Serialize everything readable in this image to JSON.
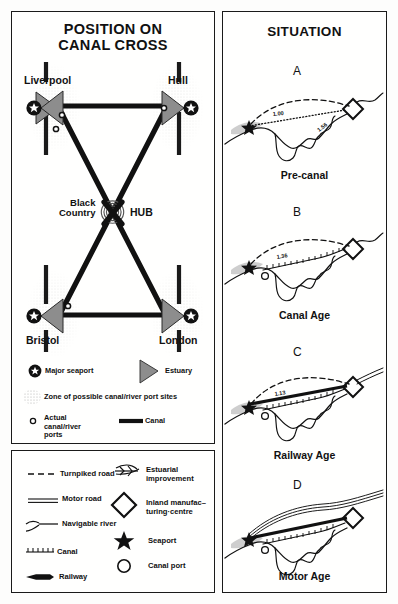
{
  "figure": {
    "background_color": "#fdfdfc",
    "ink_color": "#1a1a1a",
    "estuary_fill": "#8d8d8d",
    "zone_stipple_color": "#b9b9b9"
  },
  "map_panel": {
    "title_line1": "POSITION ON",
    "title_line2": "CANAL CROSS",
    "nodes": [
      {
        "id": "liverpool",
        "label": "Liverpool",
        "type": "major-seaport",
        "x": 38,
        "y": 96
      },
      {
        "id": "hull",
        "label": "Hull",
        "type": "major-seaport",
        "x": 178,
        "y": 96
      },
      {
        "id": "bristol",
        "label": "Bristol",
        "type": "major-seaport",
        "x": 38,
        "y": 310
      },
      {
        "id": "london",
        "label": "London",
        "type": "major-seaport",
        "x": 178,
        "y": 310
      }
    ],
    "hub": {
      "label_line1": "Black",
      "label_line2": "Country",
      "label_right": "HUB",
      "x": 108,
      "y": 203
    },
    "legend": [
      {
        "id": "major-seaport",
        "label": "Major seaport",
        "symbol": "star-in-circle"
      },
      {
        "id": "estuary",
        "label": "Estuary",
        "symbol": "gray-arrowhead"
      },
      {
        "id": "zone",
        "label": "Zone of possible canal/river port sites",
        "symbol": "stipple-patch"
      },
      {
        "id": "actual-ports",
        "label": "Actual canal/river ports",
        "symbol": "small-circle"
      },
      {
        "id": "canal",
        "label": "Canal",
        "symbol": "thick-black-line"
      }
    ]
  },
  "key_panel": {
    "left_column": [
      {
        "id": "turnpiked-road",
        "label": "Turnpiked road",
        "symbol": "dashed-line"
      },
      {
        "id": "motor-road",
        "label": "Motor road",
        "symbol": "double-line"
      },
      {
        "id": "navigable-river",
        "label": "Navigable river",
        "symbol": "river-fork"
      },
      {
        "id": "canal",
        "label": "Canal",
        "symbol": "hatched-line"
      },
      {
        "id": "railway",
        "label": "Railway",
        "symbol": "tapered-bar"
      }
    ],
    "right_column": [
      {
        "id": "estuarial-improvement",
        "label": "Estuarial improvement",
        "label_line1": "Estuarial",
        "label_line2": "improvement",
        "symbol": "feather-arrow"
      },
      {
        "id": "inland-manufacturing-centre",
        "label": "Inland manufacturing-centre",
        "label_line1": "Inland manufac–",
        "label_line2": "turing·centre",
        "symbol": "diamond-outline"
      },
      {
        "id": "seaport",
        "label": "Seaport",
        "symbol": "solid-star"
      },
      {
        "id": "canal-port",
        "label": "Canal port",
        "symbol": "open-circle"
      }
    ]
  },
  "situation_panel": {
    "title": "SITUATION",
    "diagrams": [
      {
        "letter": "A",
        "caption": "Pre-canal",
        "ratios": [
          "1.00",
          "1.56"
        ]
      },
      {
        "letter": "B",
        "caption": "Canal Age",
        "ratios": [
          "1.36"
        ]
      },
      {
        "letter": "C",
        "caption": "Railway Age",
        "ratios": [
          "1.13"
        ]
      },
      {
        "letter": "D",
        "caption": "Motor Age",
        "ratios": []
      }
    ]
  }
}
